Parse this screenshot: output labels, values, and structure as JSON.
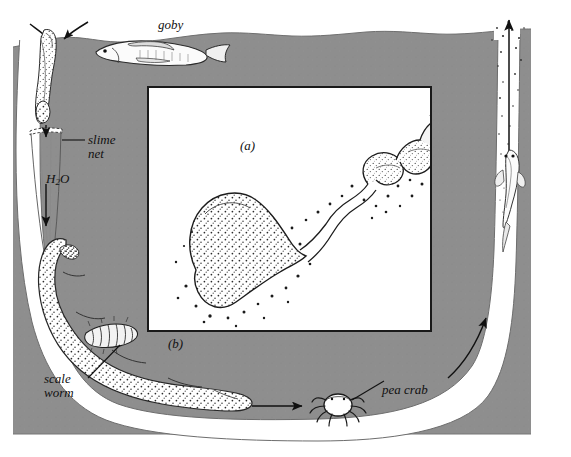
{
  "figure": {
    "panels": [
      {
        "id": "a",
        "label": "(a)",
        "caption": "slime net detail"
      },
      {
        "id": "b",
        "label": "(b)",
        "caption": "burrow overview"
      }
    ],
    "labels": {
      "goby": "goby",
      "slime_net": "slime\nnet",
      "water": "H₂O",
      "water_main": "H",
      "water_sub": "2",
      "water_tail": "O",
      "scale_worm": "scale\nworm",
      "pea_crab": "pea crab"
    },
    "organisms": [
      {
        "name": "goby",
        "location": "above sediment surface"
      },
      {
        "name": "urechis-worm",
        "location": "left limb of burrow"
      },
      {
        "name": "scale-worm",
        "location": "on worm body"
      },
      {
        "name": "pea-crab",
        "location": "bottom burrow floor"
      },
      {
        "name": "goby-in-shaft",
        "location": "right vertical shaft"
      }
    ],
    "flows": [
      {
        "name": "inflow-arrows",
        "direction": "down into left opening"
      },
      {
        "name": "water-down-arrow",
        "direction": "down"
      },
      {
        "name": "bottom-arrow",
        "direction": "right"
      },
      {
        "name": "right-curve-arrow",
        "direction": "up-right"
      },
      {
        "name": "outflow-arrow",
        "direction": "up out of right shaft"
      }
    ],
    "colors": {
      "sediment": "#8e8e8e",
      "burrow": "#ffffff",
      "ink": "#1a1a1a",
      "page": "#ffffff"
    }
  }
}
